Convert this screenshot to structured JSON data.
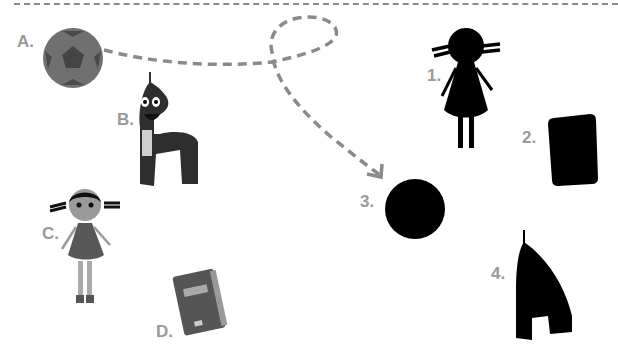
{
  "worksheet": {
    "colors": {
      "label": "#9a9a9a",
      "path": "#8a8a8a",
      "silhouette": "#000000",
      "object_dark": "#3a3a3a",
      "object_mid": "#6a6a6a"
    },
    "objects": [
      {
        "id": "A",
        "label": "A.",
        "icon": "ball-icon"
      },
      {
        "id": "B",
        "label": "B.",
        "icon": "letter-a-character-icon"
      },
      {
        "id": "C",
        "label": "C.",
        "icon": "girl-doll-icon"
      },
      {
        "id": "D",
        "label": "D.",
        "icon": "book-icon"
      }
    ],
    "silhouettes": [
      {
        "id": "1",
        "label": "1.",
        "icon": "girl-silhouette-icon"
      },
      {
        "id": "2",
        "label": "2.",
        "icon": "book-silhouette-icon"
      },
      {
        "id": "3",
        "label": "3.",
        "icon": "ball-silhouette-icon"
      },
      {
        "id": "4",
        "label": "4.",
        "icon": "letter-a-silhouette-icon"
      }
    ],
    "connection": {
      "from": "A",
      "to": "3",
      "style": "dashed-arrow"
    }
  }
}
